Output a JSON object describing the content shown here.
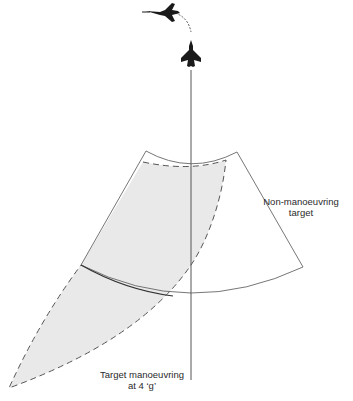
{
  "diagram": {
    "type": "air-combat-envelope",
    "labels": {
      "non_manoeuvring_line1": "Non-manoeuvring",
      "non_manoeuvring_line2": "target",
      "manoeuvring_line1": "Target manoeuvring",
      "manoeuvring_line2": "at 4 ‘g’"
    },
    "icons": [
      "target-aircraft-icon",
      "attacker-aircraft-icon"
    ],
    "colors": {
      "line": "#555555",
      "dark_line": "#333333",
      "shaded_region": "#e8e8e8",
      "aircraft": "#1a1a1a"
    }
  }
}
